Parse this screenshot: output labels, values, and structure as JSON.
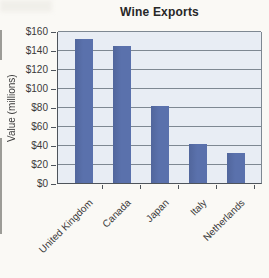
{
  "page": {
    "background": "#faf9f5"
  },
  "chart_data": {
    "type": "bar",
    "title": "Wine Exports",
    "ylabel": "Value (millions)",
    "xlabel": "",
    "categories": [
      "United Kingdom",
      "Canada",
      "Japan",
      "Italy",
      "Netherlands"
    ],
    "values": [
      152,
      144,
      81,
      41,
      32
    ],
    "ylim": [
      0,
      160
    ],
    "ytick_step": 20,
    "ytick_labels": [
      "$0",
      "$20",
      "$40",
      "$60",
      "$80",
      "$100",
      "$120",
      "$140",
      "$160"
    ],
    "grid": true,
    "legend": "none",
    "colors": {
      "bar": "#5a71ac",
      "bar_edge": "#51669c",
      "plot_bg": "#e8edf4",
      "gridline": "#7e8892",
      "axis": "#4e545b",
      "title_text": "#272727",
      "label_text": "#3a3a3a",
      "page_bg": "#faf9f5"
    }
  }
}
